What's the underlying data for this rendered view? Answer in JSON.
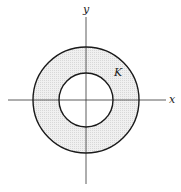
{
  "diagram": {
    "type": "annulus",
    "labels": {
      "x_axis": "x",
      "y_axis": "y",
      "region": "K"
    },
    "geometry": {
      "center": [
        86,
        100
      ],
      "outer_radius": 53,
      "inner_radius": 27
    },
    "colors": {
      "stroke": "#1a1a1a",
      "axis": "#333333",
      "fill": "#eeeeee",
      "background": "#ffffff"
    }
  }
}
